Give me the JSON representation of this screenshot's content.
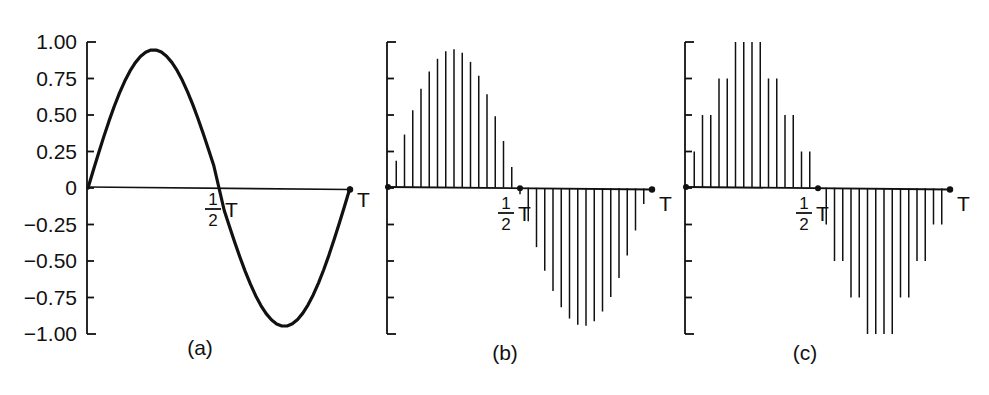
{
  "figure": {
    "title": "",
    "background_color": "#ffffff",
    "ink_color": "#111111"
  },
  "chart_data": [
    {
      "id": "panel-a",
      "type": "line",
      "title": "",
      "caption": "(a)",
      "xlabel": "",
      "ylabel": "",
      "xlim": [
        0,
        1
      ],
      "ylim": [
        -1.0,
        1.0
      ],
      "grid": false,
      "legend": "none",
      "description": "Continuous-time sine wave over one period T",
      "ytick_labels": [
        "1.00",
        "0.75",
        "0.50",
        "0.25",
        "0",
        "-0.25",
        "-0.50",
        "-0.75",
        "-1.00"
      ],
      "ytick_values": [
        1.0,
        0.75,
        0.5,
        0.25,
        0,
        -0.25,
        -0.5,
        -0.75,
        -1.0
      ],
      "xtick_labels": [
        "0",
        "1/2 T",
        "T"
      ],
      "xtick_values": [
        0,
        0.5,
        1.0
      ],
      "amplitude": 0.95,
      "x": [
        0,
        0.02,
        0.04,
        0.06,
        0.08,
        0.1,
        0.12,
        0.14,
        0.16,
        0.18,
        0.2,
        0.22,
        0.24,
        0.26,
        0.28,
        0.3,
        0.32,
        0.34,
        0.36,
        0.38,
        0.4,
        0.42,
        0.44,
        0.46,
        0.48,
        0.5,
        0.52,
        0.54,
        0.56,
        0.58,
        0.6,
        0.62,
        0.64,
        0.66,
        0.68,
        0.7,
        0.72,
        0.74,
        0.76,
        0.78,
        0.8,
        0.82,
        0.84,
        0.86,
        0.88,
        0.9,
        0.92,
        0.94,
        0.96,
        0.98,
        1.0
      ],
      "y": [
        0,
        0.1193,
        0.2367,
        0.3501,
        0.4579,
        0.5582,
        0.6496,
        0.7306,
        0.8001,
        0.857,
        0.9005,
        0.9299,
        0.9449,
        0.9453,
        0.9311,
        0.9026,
        0.8603,
        0.8049,
        0.7374,
        0.6589,
        0.5708,
        0.4745,
        0.3718,
        0.2644,
        0.1541,
        0.0,
        -0.1541,
        -0.2644,
        -0.3718,
        -0.4745,
        -0.5708,
        -0.6589,
        -0.7374,
        -0.8049,
        -0.8603,
        -0.9026,
        -0.9311,
        -0.9453,
        -0.9449,
        -0.9299,
        -0.9005,
        -0.857,
        -0.8001,
        -0.7306,
        -0.6496,
        -0.5582,
        -0.4579,
        -0.3501,
        -0.2367,
        -0.1193,
        0
      ]
    },
    {
      "id": "panel-b",
      "type": "bar",
      "title": "",
      "caption": "(b)",
      "xlabel": "",
      "ylabel": "",
      "xlim": [
        0,
        1
      ],
      "ylim": [
        -1.0,
        1.0
      ],
      "grid": false,
      "legend": "none",
      "description": "Sampled (discrete-time) sine wave: stems at uniform sampling instants, amplitudes unquantized",
      "ytick_labels": [
        "",
        "",
        "",
        "",
        "",
        "",
        "",
        "",
        ""
      ],
      "ytick_values": [
        1.0,
        0.75,
        0.5,
        0.25,
        0,
        -0.25,
        -0.5,
        -0.75,
        -1.0
      ],
      "xtick_labels": [
        "0",
        "1/2 T",
        "T"
      ],
      "xtick_values": [
        0,
        0.5,
        1.0
      ],
      "n_samples": 32,
      "categories": [
        "0",
        "1",
        "2",
        "3",
        "4",
        "5",
        "6",
        "7",
        "8",
        "9",
        "10",
        "11",
        "12",
        "13",
        "14",
        "15",
        "16",
        "17",
        "18",
        "19",
        "20",
        "21",
        "22",
        "23",
        "24",
        "25",
        "26",
        "27",
        "28",
        "29",
        "30",
        "31"
      ],
      "values": [
        0.0,
        0.186,
        0.366,
        0.533,
        0.679,
        0.798,
        0.885,
        0.937,
        0.95,
        0.926,
        0.864,
        0.768,
        0.642,
        0.491,
        0.322,
        0.143,
        -0.043,
        -0.228,
        -0.405,
        -0.566,
        -0.705,
        -0.816,
        -0.894,
        -0.937,
        -0.944,
        -0.913,
        -0.846,
        -0.746,
        -0.616,
        -0.462,
        -0.291,
        -0.109
      ]
    },
    {
      "id": "panel-c",
      "type": "bar",
      "title": "",
      "caption": "(c)",
      "xlabel": "",
      "ylabel": "",
      "xlim": [
        0,
        1
      ],
      "ylim": [
        -1.0,
        1.0
      ],
      "grid": false,
      "legend": "none",
      "description": "Sampled and quantized sine wave: stem amplitudes snapped to discrete quantization levels",
      "ytick_labels": [
        "",
        "",
        "",
        "",
        "",
        "",
        "",
        "",
        ""
      ],
      "ytick_values": [
        1.0,
        0.75,
        0.5,
        0.25,
        0,
        -0.25,
        -0.5,
        -0.75,
        -1.0
      ],
      "xtick_labels": [
        "0",
        "1/2 T",
        "T"
      ],
      "xtick_values": [
        0,
        0.5,
        1.0
      ],
      "n_samples": 32,
      "quantization_step": 0.25,
      "quantization_levels": [
        -1.0,
        -0.75,
        -0.5,
        -0.25,
        0,
        0.25,
        0.5,
        0.75,
        1.0
      ],
      "categories": [
        "0",
        "1",
        "2",
        "3",
        "4",
        "5",
        "6",
        "7",
        "8",
        "9",
        "10",
        "11",
        "12",
        "13",
        "14",
        "15",
        "16",
        "17",
        "18",
        "19",
        "20",
        "21",
        "22",
        "23",
        "24",
        "25",
        "26",
        "27",
        "28",
        "29",
        "30",
        "31"
      ],
      "values": [
        0.0,
        0.25,
        0.5,
        0.5,
        0.75,
        0.75,
        1.0,
        1.0,
        1.0,
        1.0,
        0.75,
        0.75,
        0.5,
        0.5,
        0.25,
        0.25,
        0.0,
        -0.25,
        -0.5,
        -0.5,
        -0.75,
        -0.75,
        -1.0,
        -1.0,
        -1.0,
        -1.0,
        -0.75,
        -0.75,
        -0.5,
        -0.5,
        -0.25,
        -0.25
      ]
    }
  ],
  "labels": {
    "half_period_numerator": "1",
    "half_period_denominator": "2",
    "half_period_symbol": "T",
    "period_symbol": "T",
    "zero_tick": "0",
    "caption_a": "(a)",
    "caption_b": "(b)",
    "caption_c": "(c)"
  },
  "panel_a_ticks": {
    "labels": [
      "1.00",
      "0.75",
      "0.50",
      "0.25",
      "0",
      "−0.25",
      "−0.50",
      "−0.75",
      "−1.00"
    ]
  }
}
